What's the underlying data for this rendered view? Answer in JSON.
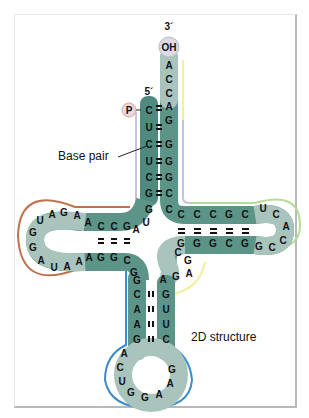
{
  "labels": {
    "three_prime": "3´",
    "five_prime": "5´",
    "oh_cap": "OH",
    "phosphate": "P",
    "base_pair": "Base pair",
    "structure": "2D structure"
  },
  "colors": {
    "stem_dark": "#4f8a7f",
    "loop_light": "#a9c4bd",
    "acceptor_outline": "#b9b4e0",
    "acceptor_tail_outline": "#f2f09a",
    "d_arm_outline": "#c0724e",
    "t_arm_outline": "#b6dc9a",
    "anticodon_outline": "#3f8cc9",
    "variable_outline": "#f4ef9e",
    "frame": "#b9b9b9"
  },
  "sequence": {
    "acceptor_3prime_tail": [
      "A",
      "C",
      "C",
      "A"
    ],
    "acceptor_5prime_strand": [
      "C",
      "U",
      "C",
      "U",
      "C",
      "G",
      "G"
    ],
    "acceptor_3prime_strand": [
      "G",
      "A",
      "G",
      "G",
      "G",
      "C",
      "C"
    ],
    "junction_1": [
      "U",
      "A"
    ],
    "d_arm_top_strand": [
      "A",
      "C",
      "C",
      "G"
    ],
    "d_loop": [
      "A",
      "G",
      "A",
      "U",
      "G",
      "G",
      "A",
      "U",
      "A",
      "A"
    ],
    "d_arm_bottom_strand": [
      "A",
      "G",
      "G",
      "C"
    ],
    "junction_2": [
      "G"
    ],
    "anticodon_left_strand": [
      "G",
      "C",
      "A",
      "A",
      "G"
    ],
    "anticodon_loop": [
      "A",
      "C",
      "U",
      "G",
      "G",
      "A",
      "A",
      "G"
    ],
    "anticodon_right_strand": [
      "C",
      "U",
      "U",
      "G"
    ],
    "variable_loop": [
      "A",
      "G",
      "A",
      "G",
      "C"
    ],
    "t_arm_bottom_strand": [
      "G",
      "G",
      "G",
      "C",
      "G"
    ],
    "t_loop": [
      "G",
      "C",
      "C",
      "A",
      "C",
      "U"
    ],
    "t_arm_top_strand": [
      "C",
      "C",
      "C",
      "G",
      "C"
    ]
  }
}
